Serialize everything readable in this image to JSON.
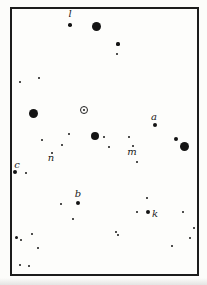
{
  "figure": {
    "background": "#fdfdfb",
    "frame_border_color": "#1c1c1c",
    "star_color": "#141414"
  },
  "chart_data": {
    "type": "scatter",
    "title": "",
    "xlabel": "",
    "ylabel": "",
    "xlim": [
      0,
      207
    ],
    "ylim": [
      0,
      285
    ],
    "special_marker": {
      "symbol": "circled-dot",
      "x": 84,
      "y": 110
    },
    "labels": [
      {
        "text": "l",
        "x": 70,
        "y": 14
      },
      {
        "text": "a",
        "x": 154,
        "y": 117
      },
      {
        "text": "m",
        "x": 132,
        "y": 152
      },
      {
        "text": "n",
        "x": 51,
        "y": 158
      },
      {
        "text": "c",
        "x": 17,
        "y": 165
      },
      {
        "text": "b",
        "x": 78,
        "y": 194
      },
      {
        "text": "k",
        "x": 155,
        "y": 214
      }
    ],
    "stars": [
      {
        "x": 96,
        "y": 26,
        "r": 4.5
      },
      {
        "x": 33,
        "y": 113,
        "r": 4.5
      },
      {
        "x": 95,
        "y": 136,
        "r": 4.2
      },
      {
        "x": 184,
        "y": 146,
        "r": 4.5
      },
      {
        "x": 70,
        "y": 25,
        "r": 1.8
      },
      {
        "x": 118,
        "y": 44,
        "r": 1.6
      },
      {
        "x": 117,
        "y": 54,
        "r": 1.2
      },
      {
        "x": 39,
        "y": 78,
        "r": 1.4
      },
      {
        "x": 20,
        "y": 82,
        "r": 1.2
      },
      {
        "x": 155,
        "y": 125,
        "r": 2
      },
      {
        "x": 176,
        "y": 139,
        "r": 2
      },
      {
        "x": 104,
        "y": 137,
        "r": 1.4
      },
      {
        "x": 109,
        "y": 147,
        "r": 1.2
      },
      {
        "x": 129,
        "y": 137,
        "r": 1.4
      },
      {
        "x": 133,
        "y": 146,
        "r": 1
      },
      {
        "x": 137,
        "y": 162,
        "r": 1.2
      },
      {
        "x": 69,
        "y": 134,
        "r": 1.2
      },
      {
        "x": 42,
        "y": 140,
        "r": 1.3
      },
      {
        "x": 62,
        "y": 145,
        "r": 1.2
      },
      {
        "x": 52,
        "y": 153,
        "r": 1.2
      },
      {
        "x": 15,
        "y": 172,
        "r": 2
      },
      {
        "x": 26,
        "y": 173,
        "r": 1.2
      },
      {
        "x": 78,
        "y": 203,
        "r": 2
      },
      {
        "x": 61,
        "y": 204,
        "r": 1.3
      },
      {
        "x": 73,
        "y": 219,
        "r": 1.2
      },
      {
        "x": 147,
        "y": 198,
        "r": 1.3
      },
      {
        "x": 137,
        "y": 212,
        "r": 1.2
      },
      {
        "x": 148,
        "y": 212,
        "r": 2.2
      },
      {
        "x": 183,
        "y": 212,
        "r": 1.2
      },
      {
        "x": 116,
        "y": 232,
        "r": 1.3
      },
      {
        "x": 118,
        "y": 235,
        "r": 1.3
      },
      {
        "x": 194,
        "y": 228,
        "r": 1.2
      },
      {
        "x": 190,
        "y": 238,
        "r": 1.2
      },
      {
        "x": 172,
        "y": 246,
        "r": 1.2
      },
      {
        "x": 16,
        "y": 237,
        "r": 1.5
      },
      {
        "x": 21,
        "y": 240,
        "r": 1.3
      },
      {
        "x": 32,
        "y": 234,
        "r": 1.3
      },
      {
        "x": 38,
        "y": 248,
        "r": 1.2
      },
      {
        "x": 20,
        "y": 265,
        "r": 1.4
      },
      {
        "x": 29,
        "y": 266,
        "r": 1.4
      }
    ]
  }
}
